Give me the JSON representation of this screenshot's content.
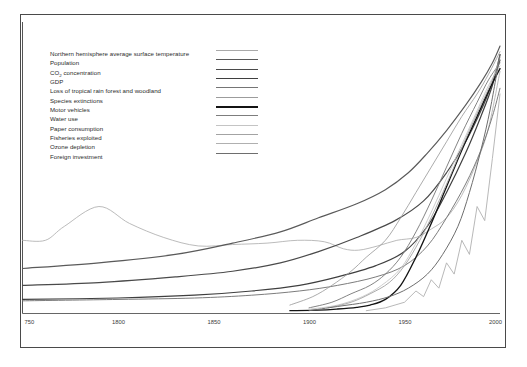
{
  "figure": {
    "background_color": "#ffffff",
    "frame_color": "#4a4a4a",
    "axis_color": "#555555"
  },
  "chart_data": {
    "type": "line",
    "title": "",
    "subtitle": "",
    "xlabel": "",
    "ylabel": "",
    "xlim": [
      1750,
      2000
    ],
    "ylim": [
      0,
      100
    ],
    "grid": false,
    "legend_position": "upper-left",
    "tick_labels_x": [
      "750",
      "1800",
      "1850",
      "1900",
      "1950",
      "2000"
    ],
    "tick_values_x": [
      1750,
      1800,
      1850,
      1900,
      1950,
      2000
    ],
    "tick_labels_y": [],
    "annotations": [],
    "series": [
      {
        "name": "Northern hemisphere average surface temperature",
        "color": "#a9a9a9",
        "width": 0.8,
        "x": [
          1750,
          1762,
          1772,
          1790,
          1806,
          1824,
          1842,
          1860,
          1878,
          1894,
          1908,
          1918,
          1926,
          1936,
          1946,
          1956,
          1964,
          1972,
          1980,
          1988,
          1994,
          2000
        ],
        "values": [
          26,
          26,
          31,
          38,
          32,
          27,
          24,
          24.5,
          25,
          26,
          25.5,
          23,
          22.5,
          24,
          26,
          27,
          30,
          34,
          42,
          54,
          66,
          86
        ]
      },
      {
        "name": "Population",
        "color": "#5a5a5a",
        "width": 1.15,
        "x": [
          1750,
          1790,
          1830,
          1860,
          1885,
          1905,
          1925,
          1940,
          1952,
          1962,
          1972,
          1982,
          1990,
          1996,
          2000
        ],
        "values": [
          16,
          18,
          21,
          25,
          29,
          34,
          39,
          44,
          50,
          57,
          65,
          74,
          82,
          89,
          95
        ]
      },
      {
        "name": "CO2 concentration",
        "color": "#4a4a4a",
        "width": 1.2,
        "x": [
          1750,
          1790,
          1830,
          1860,
          1885,
          1905,
          1925,
          1945,
          1960,
          1972,
          1982,
          1990,
          1996,
          2000
        ],
        "values": [
          10,
          11,
          13,
          15,
          18,
          22,
          27,
          33,
          40,
          50,
          61,
          72,
          82,
          90
        ]
      },
      {
        "name": "GDP",
        "color": "#3f3f3f",
        "width": 1.2,
        "x": [
          1750,
          1800,
          1840,
          1870,
          1895,
          1915,
          1935,
          1950,
          1962,
          1972,
          1982,
          1990,
          1996,
          2000
        ],
        "values": [
          5,
          5.5,
          6.5,
          8,
          10,
          13,
          17,
          22,
          31,
          43,
          57,
          70,
          81,
          92
        ]
      },
      {
        "name": "Loss of tropical rain forest and woodland",
        "color": "#757575",
        "width": 0.95,
        "x": [
          1750,
          1800,
          1840,
          1870,
          1895,
          1915,
          1935,
          1950,
          1962,
          1972,
          1982,
          1990,
          1996,
          2000
        ],
        "values": [
          4.5,
          5,
          5.5,
          6.5,
          8,
          10,
          13,
          17,
          24,
          34,
          46,
          58,
          70,
          80
        ]
      },
      {
        "name": "Species extinctions",
        "color": "#9c9c9c",
        "width": 0.85,
        "x": [
          1890,
          1902,
          1912,
          1922,
          1930,
          1940,
          1948,
          1956,
          1964,
          1972,
          1980,
          1988,
          1994,
          2000
        ],
        "values": [
          3,
          6,
          10,
          15,
          20,
          26,
          34,
          43,
          52,
          61,
          70,
          78,
          85,
          93
        ]
      },
      {
        "name": "Motor vehicles",
        "color": "#141414",
        "width": 1.35,
        "x": [
          1890,
          1905,
          1915,
          1925,
          1932,
          1940,
          1948,
          1956,
          1964,
          1972,
          1980,
          1988,
          1994,
          2000
        ],
        "values": [
          1,
          1.2,
          1.6,
          2.2,
          3,
          5,
          10,
          20,
          32,
          45,
          58,
          70,
          79,
          87
        ]
      },
      {
        "name": "Water use",
        "color": "#7d7d7d",
        "width": 0.95,
        "x": [
          1900,
          1912,
          1922,
          1932,
          1940,
          1948,
          1956,
          1964,
          1972,
          1980,
          1988,
          1994,
          2000
        ],
        "values": [
          2,
          4,
          7,
          10,
          14,
          20,
          29,
          40,
          52,
          64,
          75,
          83,
          89
        ]
      },
      {
        "name": "Paper consumption",
        "color": "#c4c4c4",
        "width": 0.85,
        "x": [
          1900,
          1915,
          1928,
          1938,
          1948,
          1956,
          1964,
          1972,
          1980,
          1988,
          1994,
          2000
        ],
        "values": [
          1.5,
          3,
          6,
          10,
          16,
          25,
          36,
          48,
          60,
          72,
          81,
          88
        ]
      },
      {
        "name": "Fisheries exploited",
        "color": "#a3a3a3",
        "width": 0.9,
        "x": [
          1910,
          1922,
          1932,
          1942,
          1950,
          1958,
          1966,
          1974,
          1982,
          1990,
          1996,
          2000
        ],
        "values": [
          2,
          4,
          7,
          11,
          17,
          26,
          37,
          49,
          62,
          74,
          83,
          91
        ]
      },
      {
        "name": "Ozone depletion",
        "color": "#b0b0b0",
        "width": 0.9,
        "x": [
          1930,
          1940,
          1950,
          1956,
          1960,
          1964,
          1968,
          1972,
          1976,
          1980,
          1984,
          1988,
          1992,
          1996,
          2000
        ],
        "values": [
          1,
          2,
          4,
          8,
          6,
          12,
          9,
          18,
          14,
          26,
          21,
          38,
          33,
          55,
          78
        ]
      },
      {
        "name": "Foreign investment",
        "color": "#6e6e6e",
        "width": 1.0,
        "x": [
          1900,
          1915,
          1930,
          1942,
          1952,
          1962,
          1970,
          1978,
          1984,
          1990,
          1995,
          2000
        ],
        "values": [
          1,
          2.5,
          4,
          6,
          9,
          14,
          21,
          31,
          43,
          58,
          73,
          92
        ]
      }
    ]
  },
  "legend": {
    "entries": [
      {
        "label": "Northern hemisphere average surface temperature",
        "color": "#a9a9a9",
        "thickness": 0.8
      },
      {
        "label": "Population",
        "color": "#5a5a5a",
        "thickness": 1.9
      },
      {
        "label": "CO2 concentration",
        "color": "#4a4a4a",
        "thickness": 1.9,
        "has_subscript": true,
        "label_main": "CO",
        "label_sub": "2",
        "label_rest": " concentration"
      },
      {
        "label": "GDP",
        "color": "#3f3f3f",
        "thickness": 1.9
      },
      {
        "label": "Loss of tropical rain forest and woodland",
        "color": "#757575",
        "thickness": 1.4
      },
      {
        "label": "Species extinctions",
        "color": "#9c9c9c",
        "thickness": 1.2
      },
      {
        "label": "Motor vehicles",
        "color": "#141414",
        "thickness": 2.1
      },
      {
        "label": "Water use",
        "color": "#7d7d7d",
        "thickness": 1.4
      },
      {
        "label": "Paper consumption",
        "color": "#c4c4c4",
        "thickness": 1.2
      },
      {
        "label": "Fisheries exploited",
        "color": "#a3a3a3",
        "thickness": 1.3
      },
      {
        "label": "Ozone depletion",
        "color": "#b0b0b0",
        "thickness": 1.2
      },
      {
        "label": "Foreign investment",
        "color": "#6e6e6e",
        "thickness": 1.4
      }
    ]
  }
}
